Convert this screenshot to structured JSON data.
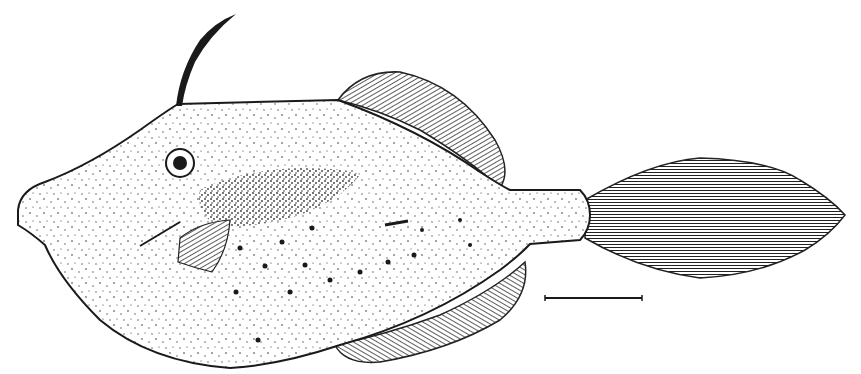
{
  "figure": {
    "style": "stippled line drawing",
    "colors": {
      "ink": "#1a1a1a",
      "paper": "#ffffff",
      "fin": "#6e6e6e"
    },
    "scale_bar": {
      "x1": 545,
      "x2": 642,
      "y": 298
    }
  }
}
